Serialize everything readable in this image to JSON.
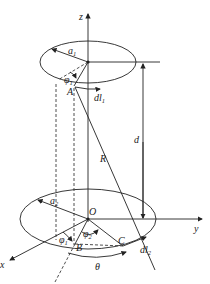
{
  "diagram": {
    "type": "two coaxial circular current loops",
    "labels": {
      "z_axis": "z",
      "y_axis": "y",
      "x_axis": "x",
      "origin": "O",
      "radius_top": "a",
      "radius_top_sub": "1",
      "radius_bottom": "a",
      "radius_bottom_sub": "2",
      "point_A": "A",
      "point_B": "B",
      "point_C": "C",
      "phi1_top": "φ",
      "phi1_top_sub": "1",
      "phi1_bottom": "φ",
      "phi1_bottom_sub": "1",
      "phi2": "φ",
      "phi2_sub": "2",
      "dl1": "dl",
      "dl1_sub": "1",
      "dl2": "dl",
      "dl2_sub": "2",
      "distance": "d",
      "separation": "R",
      "angle": "θ"
    },
    "colors": {
      "stroke": "#222222",
      "background": "#ffffff"
    }
  }
}
